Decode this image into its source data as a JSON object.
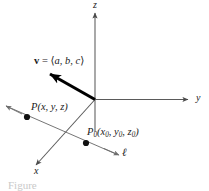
{
  "figure": {
    "background_color": "#ffffff",
    "axis_color": "#5a5a5a",
    "line_color": "#6e6e6e",
    "vector_color": "#000000",
    "point_color": "#111111",
    "text_color": "#1a1a1a",
    "caption_color": "#c9c9c9",
    "width": 209,
    "height": 191
  },
  "axes": [
    {
      "name": "z-axis",
      "label": "z",
      "direction": "up",
      "label_x": 93,
      "label_y": 1
    },
    {
      "name": "y-axis",
      "label": "y",
      "direction": "right",
      "label_x": 196,
      "label_y": 94
    },
    {
      "name": "x-axis",
      "label": "x",
      "direction": "down-left",
      "label_x": 36,
      "label_y": 166
    }
  ],
  "vector": {
    "name": "direction-vector",
    "bold_symbol": "v",
    "equals": " = ",
    "open_bracket": "⟨",
    "components": "a, b, c",
    "close_bracket": "⟩",
    "label_x": 36,
    "label_y": 57
  },
  "line": {
    "name": "line-ell",
    "label": "ℓ",
    "label_x": 122,
    "label_y": 150
  },
  "points": [
    {
      "name": "point-P",
      "label_prefix": "P",
      "subscript": "",
      "open_paren": "(",
      "coords_plain": "x, y, z",
      "close_paren": ")",
      "dot_x": 27,
      "dot_y": 117,
      "label_x": 32,
      "label_y": 103
    },
    {
      "name": "point-P0",
      "label_prefix": "P",
      "subscript": "0",
      "open_paren": "(",
      "coords_sub": [
        "x",
        "0",
        ", ",
        "y",
        "0",
        ", ",
        "z",
        "0"
      ],
      "close_paren": ")",
      "dot_x": 86,
      "dot_y": 143,
      "label_x": 88,
      "label_y": 128
    }
  ],
  "caption": {
    "text": "Figure",
    "visible": true
  }
}
